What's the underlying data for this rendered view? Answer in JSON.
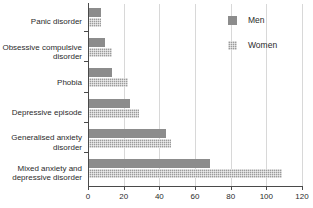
{
  "chart_data": {
    "type": "bar",
    "orientation": "horizontal",
    "title": "",
    "subtitle": "",
    "xlabel": "",
    "ylabel": "",
    "xlim": [
      0,
      120
    ],
    "xticks": [
      0,
      20,
      40,
      60,
      80,
      100,
      120
    ],
    "xtick_labels": [
      "0",
      "20",
      "40",
      "60",
      "80",
      "100",
      "120"
    ],
    "grid": "vertical",
    "legend_position": "top-right",
    "categories": [
      "Panic disorder",
      "Obsessive compulsive disorder",
      "Phobia",
      "Depressive episode",
      "Generalised anxiety disorder",
      "Mixed anxiety and depressive disorder"
    ],
    "category_lines": [
      [
        "Panic disorder"
      ],
      [
        "Obsessive compulsive",
        "disorder"
      ],
      [
        "Phobia"
      ],
      [
        "Depressive episode"
      ],
      [
        "Generalised anxiety",
        "disorder"
      ],
      [
        "Mixed anxiety and",
        "depressive disorder"
      ]
    ],
    "series": [
      {
        "name": "Men",
        "color": "#8c8c8c",
        "fill": "solid",
        "values": [
          7,
          9,
          13,
          23,
          43,
          68
        ]
      },
      {
        "name": "Women",
        "color": "#9b9b9b",
        "fill": "crosshatch",
        "values": [
          7,
          13,
          22,
          28,
          46,
          108
        ]
      }
    ]
  },
  "legend": {
    "items": [
      {
        "label": "Men"
      },
      {
        "label": "Women"
      }
    ]
  },
  "colors": {
    "men": "#8c8c8c",
    "women": "#9b9b9b",
    "axis": "#4a4a4a",
    "grid": "#d8d8d8",
    "text": "#2b2b2b",
    "background": "#ffffff"
  }
}
